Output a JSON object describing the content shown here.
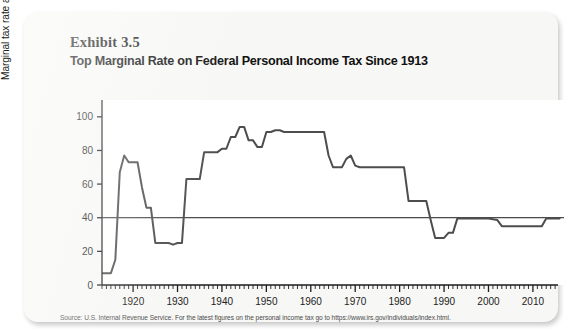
{
  "exhibit": {
    "number_label": "Exhibit 3.5",
    "title": "Top Marginal Rate on Federal Personal Income Tax Since 1913",
    "source": "Source: U.S. Internal Revenue Service. For the latest figures on the personal income tax go to https://www.irs.gov/individuals/index.html."
  },
  "colors": {
    "card_background": "#f7f7f5",
    "plot_background": "#ffffff",
    "line": "#4d4d4d",
    "axis": "#1c1c1c",
    "text": "#111111"
  },
  "chart_data": {
    "type": "line",
    "title": "Top Marginal Rate on Federal Personal Income Tax Since 1913",
    "xlabel": "",
    "ylabel": "Marginal tax rate as percent of income",
    "xlim": [
      1913,
      2017
    ],
    "ylim": [
      0,
      110
    ],
    "yticks": [
      0,
      20,
      40,
      60,
      80,
      100
    ],
    "ytick_labels": [
      "0",
      "20",
      "40",
      "60",
      "80",
      "100"
    ],
    "xticks": [
      1920,
      1930,
      1940,
      1950,
      1960,
      1970,
      1980,
      1990,
      2000,
      2010
    ],
    "xtick_labels": [
      "1920",
      "1930",
      "1940",
      "1950",
      "1960",
      "1970",
      "1980",
      "1990",
      "2000",
      "2010"
    ],
    "minor_tick_interval": 1,
    "grid": false,
    "legend": "none",
    "reference_line": {
      "y": 40,
      "label": ""
    },
    "series": [
      {
        "name": "Top marginal federal personal income tax rate",
        "x": [
          1913,
          1914,
          1915,
          1916,
          1917,
          1918,
          1919,
          1920,
          1921,
          1922,
          1923,
          1924,
          1925,
          1926,
          1927,
          1928,
          1929,
          1930,
          1931,
          1932,
          1933,
          1934,
          1935,
          1936,
          1937,
          1938,
          1939,
          1940,
          1941,
          1942,
          1943,
          1944,
          1945,
          1946,
          1947,
          1948,
          1949,
          1950,
          1951,
          1952,
          1953,
          1954,
          1955,
          1956,
          1957,
          1958,
          1959,
          1960,
          1961,
          1962,
          1963,
          1964,
          1965,
          1966,
          1967,
          1968,
          1969,
          1970,
          1971,
          1972,
          1973,
          1974,
          1975,
          1976,
          1977,
          1978,
          1979,
          1980,
          1981,
          1982,
          1983,
          1984,
          1985,
          1986,
          1987,
          1988,
          1989,
          1990,
          1991,
          1992,
          1993,
          1994,
          1995,
          1996,
          1997,
          1998,
          1999,
          2000,
          2001,
          2002,
          2003,
          2004,
          2005,
          2006,
          2007,
          2008,
          2009,
          2010,
          2011,
          2012,
          2013,
          2014,
          2015,
          2016
        ],
        "y": [
          7,
          7,
          7,
          15,
          67,
          77,
          73,
          73,
          73,
          58,
          46,
          46,
          25,
          25,
          25,
          25,
          24,
          25,
          25,
          63,
          63,
          63,
          63,
          79,
          79,
          79,
          79,
          81,
          81,
          88,
          88,
          94,
          94,
          86,
          86,
          82,
          82,
          91,
          91,
          92,
          92,
          91,
          91,
          91,
          91,
          91,
          91,
          91,
          91,
          91,
          91,
          77,
          70,
          70,
          70,
          75,
          77,
          71,
          70,
          70,
          70,
          70,
          70,
          70,
          70,
          70,
          70,
          70,
          70,
          50,
          50,
          50,
          50,
          50,
          38.5,
          28,
          28,
          28,
          31,
          31,
          39.6,
          39.6,
          39.6,
          39.6,
          39.6,
          39.6,
          39.6,
          39.6,
          39.1,
          38.6,
          35,
          35,
          35,
          35,
          35,
          35,
          35,
          35,
          35,
          35,
          39.6,
          39.6,
          39.6,
          39.6
        ]
      }
    ]
  }
}
